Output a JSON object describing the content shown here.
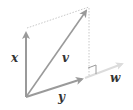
{
  "diagram": {
    "labels": {
      "x": "x",
      "v": "v",
      "y": "y",
      "w": "w"
    },
    "colors": {
      "arrow": "#9a9a9a",
      "w_line": "#d8d8d8",
      "dotted": "#c8c8c8",
      "text": "#333333"
    }
  }
}
